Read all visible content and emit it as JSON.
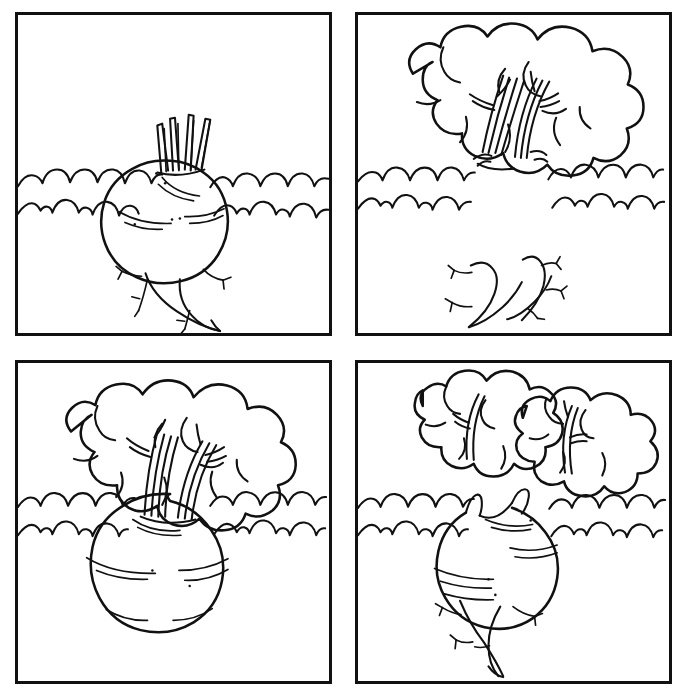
{
  "document": {
    "title": "Turnip Parts Matrix",
    "description": "Four-panel black and white line drawing grid showing a turnip plant decomposed into bulb, leaves and roots",
    "background_color": "#ffffff",
    "ink_color": "#111111",
    "width": 680,
    "height": 696,
    "grid": {
      "columns": 2,
      "rows": 2
    }
  },
  "panels": [
    {
      "id": "panel-1",
      "position": "top-left",
      "label": "Turnip bulb with cut stems and taproot",
      "parts_present": [
        "ground-line",
        "bulb",
        "cut-stems",
        "taproot"
      ],
      "parts_absent": [
        "leaf-canopy"
      ],
      "notes": "Bulb sits in the ground line, short cut stalks above, branching taproot below"
    },
    {
      "id": "panel-2",
      "position": "top-right",
      "label": "Leaf canopy above ground and detached roots below",
      "parts_present": [
        "ground-line",
        "leaf-canopy",
        "stems",
        "detached-roots"
      ],
      "parts_absent": [
        "bulb"
      ],
      "notes": "Ground line is interrupted where the bulb would be; roots float unattached"
    },
    {
      "id": "panel-3",
      "position": "bottom-left",
      "label": "Turnip bulb with full leaf canopy, no roots",
      "parts_present": [
        "ground-line",
        "bulb",
        "stems",
        "leaf-canopy"
      ],
      "parts_absent": [
        "taproot"
      ],
      "notes": "Complete top half of plant, bulb resting on ground line"
    },
    {
      "id": "panel-4",
      "position": "bottom-right",
      "label": "Turnip bulb with taproot and detached leaf canopy",
      "parts_present": [
        "ground-line",
        "bulb",
        "stem-stubs",
        "taproot",
        "detached-leaf-canopy"
      ],
      "parts_absent": [
        "attached-stems"
      ],
      "notes": "Leaf canopy floats separately above the bulb"
    }
  ],
  "legend": {
    "ground_line_style": "double scalloped wavy line",
    "drawing_style": "ink outline, no fill, hand-drawn",
    "stroke_widths": {
      "border": 3,
      "outline": 2.6,
      "detail": 1.7
    }
  }
}
